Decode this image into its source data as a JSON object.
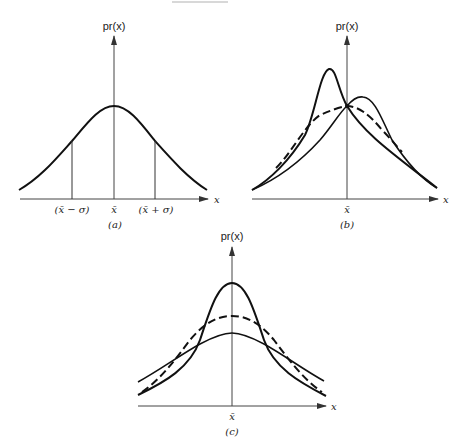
{
  "figure": {
    "panels": [
      {
        "id": "a",
        "caption": "(a)",
        "y_axis_label": "pr(x)",
        "x_axis_label": "x",
        "tick_labels": [
          "(x̄ − σ)",
          "x̄",
          "(x̄ + σ)"
        ],
        "description": "Single symmetric bell-shaped distribution with vertical lines at mean minus and plus one standard deviation"
      },
      {
        "id": "b",
        "caption": "(b)",
        "y_axis_label": "pr(x)",
        "x_axis_label": "x",
        "tick_labels": [
          "x̄"
        ],
        "description": "Skewed/asymmetric distributions: sharp peak left of mean, lower hump right of mean, dashed intermediate curve, all crossing at the mean"
      },
      {
        "id": "c",
        "caption": "(c)",
        "y_axis_label": "pr(x)",
        "x_axis_label": "x",
        "tick_labels": [
          "x̄"
        ],
        "description": "Three symmetric distributions with same mean and differing spread: tall narrow solid, medium dashed, flat wide solid"
      }
    ]
  }
}
